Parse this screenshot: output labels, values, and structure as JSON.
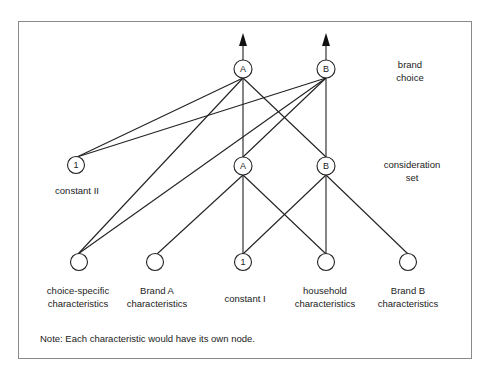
{
  "diagram": {
    "type": "network",
    "frame": {
      "x": 18,
      "y": 21,
      "width": 454,
      "height": 338,
      "border_color": "#8a8a8a"
    },
    "levels": {
      "brand_choice": {
        "line1": "brand",
        "line2": "choice"
      },
      "consideration_set": {
        "line1": "consideration",
        "line2": "set"
      }
    },
    "nodes": {
      "top_a": {
        "label": "A",
        "x": 243,
        "y": 69
      },
      "top_b": {
        "label": "B",
        "x": 326,
        "y": 69
      },
      "mid_const2": {
        "label": "1",
        "x": 76,
        "y": 165
      },
      "mid_a": {
        "label": "A",
        "x": 243,
        "y": 166
      },
      "mid_b": {
        "label": "B",
        "x": 326,
        "y": 166
      },
      "bot_choice": {
        "label": "",
        "x": 79,
        "y": 262
      },
      "bot_brand_a": {
        "label": "",
        "x": 155,
        "y": 262
      },
      "bot_const1": {
        "label": "1",
        "x": 243,
        "y": 262
      },
      "bot_household": {
        "label": "",
        "x": 326,
        "y": 262
      },
      "bot_brand_b": {
        "label": "",
        "x": 408,
        "y": 262
      }
    },
    "node_labels": {
      "constant_ii": "constant II",
      "choice_specific": {
        "line1": "choice-specific",
        "line2": "characteristics"
      },
      "brand_a": {
        "line1": "Brand A",
        "line2": "characteristics"
      },
      "constant_i": "constant I",
      "household": {
        "line1": "household",
        "line2": "characteristics"
      },
      "brand_b": {
        "line1": "Brand B",
        "line2": "characteristics"
      }
    },
    "edges": [
      [
        "top_a",
        "mid_const2"
      ],
      [
        "top_a",
        "bot_choice"
      ],
      [
        "top_a",
        "mid_a"
      ],
      [
        "top_a",
        "mid_b"
      ],
      [
        "top_b",
        "mid_const2"
      ],
      [
        "top_b",
        "bot_choice"
      ],
      [
        "top_b",
        "mid_a"
      ],
      [
        "top_b",
        "mid_b"
      ],
      [
        "mid_a",
        "bot_brand_a"
      ],
      [
        "mid_a",
        "bot_const1"
      ],
      [
        "mid_a",
        "bot_household"
      ],
      [
        "mid_b",
        "bot_const1"
      ],
      [
        "mid_b",
        "bot_household"
      ],
      [
        "mid_b",
        "bot_brand_b"
      ]
    ],
    "outputs": [
      {
        "from": "top_a",
        "direction": "up"
      },
      {
        "from": "top_b",
        "direction": "up"
      }
    ],
    "note": "Note: Each characteristic would have its own node."
  }
}
